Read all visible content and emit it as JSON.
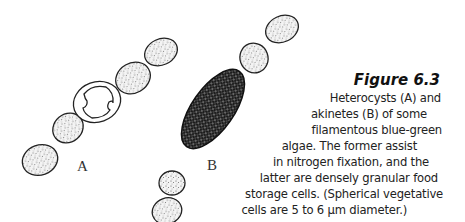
{
  "figure": {
    "title": "Figure 6.3",
    "caption_lines": [
      "Heterocysts (A) and",
      "akinetes (B) of some",
      "filamentous blue-green",
      "algae. The former assist",
      "in nitrogen fixation, and the",
      "latter are densely granular food",
      "storage cells. (Spherical vegetative",
      "cells are 5 to 6 µm diameter.)"
    ],
    "labels": {
      "a": "A",
      "b": "B"
    }
  },
  "colors": {
    "outline": "#222222",
    "stipple": "#555555",
    "akinete_fill": "#1a1a1a",
    "text": "#222222"
  }
}
